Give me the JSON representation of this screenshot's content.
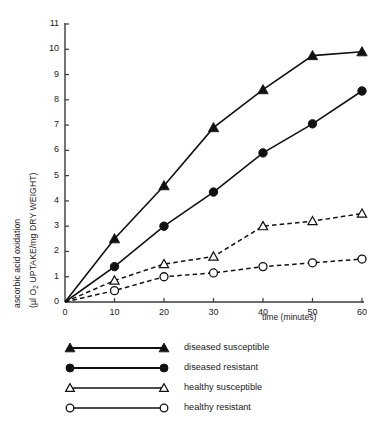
{
  "chart_data": {
    "type": "line",
    "title": "",
    "xlabel": "time (minutes)",
    "ylabel": "ascorbic acid oxidation (μl O2 UPTAKE/mg DRY WEIGHT)",
    "ylabel_line1": "ascorbic acid oxidation",
    "ylabel_line2_pre": "(µl O",
    "ylabel_line2_sub": "2",
    "ylabel_line2_post": " UPTAKE/mg DRY WEIGHT)",
    "x": [
      0,
      10,
      20,
      30,
      40,
      50,
      60
    ],
    "xlim": [
      0,
      60
    ],
    "ylim": [
      0,
      11
    ],
    "xticks": [
      "0",
      "10",
      "20",
      "30",
      "40",
      "50",
      "60"
    ],
    "yticks": [
      "0",
      "1",
      "2",
      "3",
      "4",
      "5",
      "6",
      "7",
      "8",
      "9",
      "10",
      "11"
    ],
    "grid": false,
    "legend_position": "below-plot",
    "series": [
      {
        "name": "diseased susceptible",
        "marker": "filled-triangle",
        "line": "solid",
        "color": "#111111",
        "values": [
          0,
          2.5,
          4.6,
          6.9,
          8.4,
          9.75,
          9.9
        ]
      },
      {
        "name": "diseased resistant",
        "marker": "filled-circle",
        "line": "solid",
        "color": "#111111",
        "values": [
          0,
          1.4,
          3.0,
          4.35,
          5.9,
          7.05,
          8.35
        ]
      },
      {
        "name": "healthy susceptible",
        "marker": "open-triangle",
        "line": "dashed",
        "color": "#111111",
        "values": [
          0,
          0.85,
          1.5,
          1.8,
          3.0,
          3.2,
          3.5
        ]
      },
      {
        "name": "healthy resistant",
        "marker": "open-circle",
        "line": "dashed",
        "color": "#111111",
        "values": [
          0,
          0.45,
          1.0,
          1.15,
          1.4,
          1.55,
          1.7
        ]
      }
    ]
  },
  "legend": {
    "items": [
      {
        "label": "diseased susceptible",
        "marker": "filled-triangle",
        "line": "solid"
      },
      {
        "label": "diseased resistant",
        "marker": "filled-circle",
        "line": "solid"
      },
      {
        "label": "healthy susceptible",
        "marker": "open-triangle",
        "line": "solid"
      },
      {
        "label": "healthy resistant",
        "marker": "open-circle",
        "line": "solid"
      }
    ]
  },
  "axis": {
    "x_title": "time (minutes)"
  },
  "colors": {
    "ink": "#111111",
    "axis": "#3a3a3a",
    "background": "#ffffff"
  }
}
